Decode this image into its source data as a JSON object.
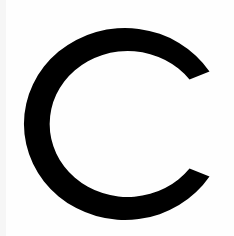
{
  "image": {
    "letter": "C",
    "colors": {
      "background": "#fefefe",
      "glyph": "#000000"
    }
  }
}
